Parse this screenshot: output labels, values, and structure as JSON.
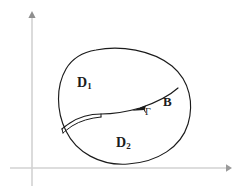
{
  "figure": {
    "type": "math-diagram",
    "background_color": "#ffffff",
    "axes": {
      "color": "#cfcfcf",
      "origin": {
        "x": 32,
        "y": 168
      },
      "x_axis": {
        "from_x": 10,
        "to_x": 231,
        "y": 168,
        "arrow": "right"
      },
      "y_axis": {
        "x": 32,
        "from_y": 185,
        "to_y": 12,
        "arrow": "up"
      }
    },
    "curve_color": "#1b1b1b",
    "labels": {
      "d1": {
        "base": "D",
        "sub": "1",
        "x": 77,
        "y": 76
      },
      "d2": {
        "base": "D",
        "sub": "2",
        "x": 116,
        "y": 136
      },
      "boundary": {
        "text": "B",
        "x": 163,
        "y": 95
      },
      "gamma": {
        "text": "Γ",
        "x": 145,
        "y": 107
      }
    },
    "arrow": {
      "name": "gamma-orientation-arrow",
      "direction": "left",
      "x": 141,
      "y": 110
    },
    "regions": [
      {
        "name": "D1",
        "position": "upper-left"
      },
      {
        "name": "D2",
        "position": "lower"
      }
    ]
  }
}
